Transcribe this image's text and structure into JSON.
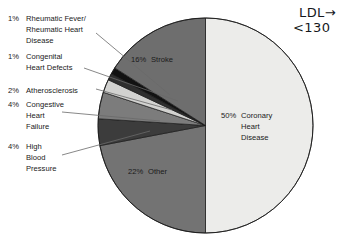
{
  "chart_data": {
    "type": "pie",
    "title": "",
    "subtitle": "",
    "xlabel": "",
    "ylabel": "",
    "legend_position": "callout-labels",
    "grid": false,
    "units": "percent",
    "total": 100,
    "categories": [
      "Coronary Heart Disease",
      "Stroke",
      "Rheumatic Fever/Rheumatic Heart Disease",
      "Congenital Heart Defects",
      "Atherosclerosis",
      "Congestive Heart Failure",
      "High Blood Pressure",
      "Other"
    ],
    "values": [
      50,
      16,
      1,
      1,
      2,
      4,
      4,
      22
    ],
    "slices": [
      {
        "label": "Coronary\nHeart\nDisease",
        "label_flat": "Coronary Heart Disease",
        "percent_text": "50%",
        "value": 50,
        "color": "#ececea",
        "label_placement": "inside",
        "label_x": 224,
        "label_y": 115,
        "pct_x": 205,
        "pct_y": 115
      },
      {
        "label": "Stroke",
        "label_flat": "Stroke",
        "percent_text": "16%",
        "value": 16,
        "color": "#6e6e6e",
        "label_placement": "inside",
        "label_x": 158,
        "label_y": 59,
        "pct_x": 135,
        "pct_y": 59
      },
      {
        "label": "Rheumatic Fever/\nRheumatic Heart\nDisease",
        "label_flat": "Rheumatic Fever/Rheumatic Heart Disease",
        "percent_text": "1%",
        "value": 1,
        "color": "#121212",
        "label_placement": "callout",
        "label_x": 25,
        "label_y": 13
      },
      {
        "label": "Congenital\nHeart Defects",
        "label_flat": "Congenital Heart Defects",
        "percent_text": "1%",
        "value": 1,
        "color": "#2f2f2f",
        "label_placement": "callout",
        "label_x": 25,
        "label_y": 51
      },
      {
        "label": "Atherosclerosis",
        "label_flat": "Atherosclerosis",
        "percent_text": "2%",
        "value": 2,
        "color": "#d2d2d0",
        "label_placement": "callout",
        "label_x": 25,
        "label_y": 85
      },
      {
        "label": "Congestive\nHeart\nFailure",
        "label_flat": "Congestive Heart Failure",
        "percent_text": "4%",
        "value": 4,
        "color": "#7c7c7c",
        "label_placement": "callout",
        "label_x": 25,
        "label_y": 99
      },
      {
        "label": "High\nBlood\nPressure",
        "label_flat": "High Blood Pressure",
        "percent_text": "4%",
        "value": 4,
        "color": "#3c3c3c",
        "label_placement": "callout",
        "label_x": 25,
        "label_y": 141
      },
      {
        "label": "Other",
        "label_flat": "Other",
        "percent_text": "22%",
        "value": 22,
        "color": "#737373",
        "label_placement": "inside",
        "label_x": 153,
        "label_y": 167,
        "pct_x": 131,
        "pct_y": 167
      }
    ]
  },
  "annotation": {
    "line1": "LDL→",
    "line2": "<130",
    "color": "#15181c"
  }
}
